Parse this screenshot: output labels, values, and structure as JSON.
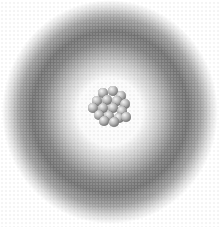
{
  "image": {
    "subject": "atomic-cluster-with-diffuse-ring",
    "palette": {
      "background": "#ffffff",
      "ring_dark": "#737373",
      "ring_light": "#e1e1e1",
      "atom_highlight": "#f4f4f4",
      "atom_shadow": "#4a4a4a"
    },
    "ring": {
      "center_x": 110,
      "center_y": 112,
      "inner_radius": 45,
      "outer_radius": 108
    },
    "cluster": {
      "center_x": 111,
      "center_y": 107,
      "atoms": [
        {
          "x": 103,
          "y": 93
        },
        {
          "x": 113,
          "y": 91
        },
        {
          "x": 121,
          "y": 96
        },
        {
          "x": 97,
          "y": 101
        },
        {
          "x": 107,
          "y": 100
        },
        {
          "x": 117,
          "y": 101
        },
        {
          "x": 125,
          "y": 104
        },
        {
          "x": 93,
          "y": 108
        },
        {
          "x": 103,
          "y": 108
        },
        {
          "x": 113,
          "y": 108
        },
        {
          "x": 122,
          "y": 111
        },
        {
          "x": 99,
          "y": 115
        },
        {
          "x": 109,
          "y": 116
        },
        {
          "x": 119,
          "y": 118
        },
        {
          "x": 126,
          "y": 117
        },
        {
          "x": 104,
          "y": 121
        },
        {
          "x": 114,
          "y": 122
        }
      ]
    }
  }
}
